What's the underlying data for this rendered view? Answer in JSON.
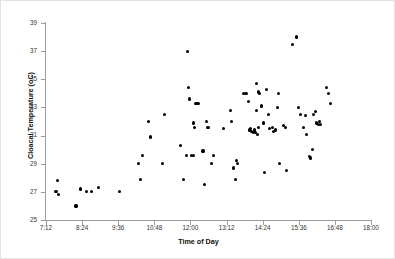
{
  "chart_data": {
    "type": "scatter",
    "title": "",
    "xlabel": "Time of Day",
    "ylabel": "Cloacal Temperature (oC)",
    "xlim": [
      432,
      1080
    ],
    "ylim": [
      25,
      39
    ],
    "xtick_labels": [
      "7:12",
      "8:24",
      "9:36",
      "10:48",
      "12:00",
      "13:12",
      "14:24",
      "15:36",
      "16:48",
      "18:00"
    ],
    "xtick_values": [
      432,
      504,
      576,
      648,
      720,
      792,
      864,
      936,
      1008,
      1080
    ],
    "ytick_labels": [
      "25",
      "27",
      "29",
      "31",
      "33",
      "35",
      "37",
      "39"
    ],
    "ytick_values": [
      25,
      27,
      29,
      31,
      33,
      35,
      37,
      39
    ],
    "grid": false,
    "legend": false,
    "marker": "filled-circle",
    "marker_color": "#000000",
    "series": [
      {
        "name": "Cloacal temperature",
        "points": [
          [
            455,
            27.8
          ],
          [
            452,
            27.0
          ],
          [
            457,
            26.8
          ],
          [
            492,
            26.0
          ],
          [
            500,
            27.2
          ],
          [
            512,
            27.0
          ],
          [
            522,
            27.0
          ],
          [
            537,
            27.3
          ],
          [
            578,
            27.0
          ],
          [
            616,
            29.0
          ],
          [
            620,
            27.9
          ],
          [
            624,
            29.6
          ],
          [
            637,
            32.0
          ],
          [
            641,
            30.9
          ],
          [
            668,
            32.5
          ],
          [
            664,
            29.0
          ],
          [
            700,
            30.3
          ],
          [
            706,
            27.9
          ],
          [
            712,
            29.6
          ],
          [
            716,
            34.4
          ],
          [
            718,
            33.6
          ],
          [
            714,
            37.0
          ],
          [
            726,
            31.9
          ],
          [
            728,
            31.6
          ],
          [
            730,
            33.3
          ],
          [
            733,
            33.3
          ],
          [
            736,
            33.3
          ],
          [
            722,
            29.6
          ],
          [
            726,
            29.6
          ],
          [
            745,
            29.9
          ],
          [
            748,
            27.5
          ],
          [
            752,
            32.0
          ],
          [
            755,
            31.6
          ],
          [
            762,
            29.0
          ],
          [
            766,
            29.6
          ],
          [
            786,
            31.5
          ],
          [
            800,
            32.8
          ],
          [
            802,
            32.0
          ],
          [
            806,
            28.7
          ],
          [
            812,
            29.2
          ],
          [
            814,
            29.0
          ],
          [
            810,
            27.9
          ],
          [
            826,
            34.0
          ],
          [
            829,
            34.0
          ],
          [
            832,
            34.0
          ],
          [
            836,
            33.4
          ],
          [
            838,
            31.4
          ],
          [
            840,
            31.5
          ],
          [
            842,
            31.3
          ],
          [
            845,
            31.2
          ],
          [
            847,
            31.4
          ],
          [
            849,
            31.2
          ],
          [
            852,
            34.7
          ],
          [
            855,
            34.1
          ],
          [
            858,
            34.0
          ],
          [
            851,
            32.8
          ],
          [
            853,
            31.1
          ],
          [
            856,
            31.6
          ],
          [
            862,
            33.1
          ],
          [
            865,
            31.9
          ],
          [
            868,
            28.4
          ],
          [
            872,
            34.3
          ],
          [
            875,
            32.5
          ],
          [
            878,
            31.5
          ],
          [
            884,
            31.6
          ],
          [
            886,
            31.3
          ],
          [
            889,
            31.4
          ],
          [
            894,
            33.0
          ],
          [
            896,
            34.0
          ],
          [
            898,
            29.0
          ],
          [
            906,
            31.7
          ],
          [
            909,
            31.6
          ],
          [
            912,
            28.5
          ],
          [
            924,
            37.5
          ],
          [
            931,
            38.0
          ],
          [
            936,
            33.0
          ],
          [
            940,
            32.5
          ],
          [
            946,
            31.6
          ],
          [
            949,
            32.4
          ],
          [
            952,
            31.1
          ],
          [
            958,
            29.5
          ],
          [
            960,
            29.4
          ],
          [
            963,
            30.0
          ],
          [
            966,
            32.5
          ],
          [
            969,
            32.7
          ],
          [
            972,
            31.9
          ],
          [
            975,
            31.8
          ],
          [
            977,
            32.0
          ],
          [
            979,
            31.8
          ],
          [
            992,
            34.4
          ],
          [
            996,
            34.0
          ],
          [
            999,
            33.3
          ]
        ]
      }
    ]
  }
}
